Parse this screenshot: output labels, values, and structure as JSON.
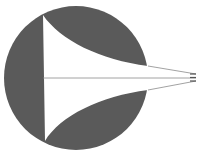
{
  "diagram": {
    "colors": {
      "disc": "#5a5a5a",
      "cutout": "#ffffff",
      "rays": "#8a8a8a",
      "background": "#ffffff"
    },
    "disc": {
      "cx": 76,
      "cy": 78,
      "r": 72
    },
    "focal_point": {
      "x": 196,
      "y": 78
    }
  }
}
